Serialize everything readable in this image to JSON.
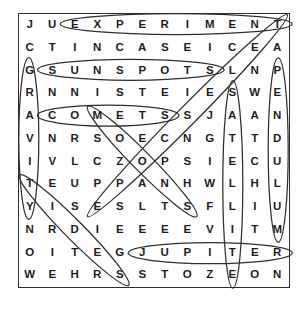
{
  "puzzle": {
    "kind": "word-search",
    "rows_count": 12,
    "cols_count": 12,
    "rows": [
      "JUEXPERIMENT",
      "CTINCASEICEA",
      "GSUNSPOTSLNP",
      "RNNISTEIESWE",
      "ACOMETSSJAAN",
      "VNRSOECNGTTD",
      "IVLCZOPSIECU",
      "TEUPPANHWLHL",
      "YISESLTSFLIU",
      "NRDIEEEEVITM",
      "OITEGJUPITER",
      "WEHRSSTOZEON"
    ]
  },
  "solutions": [
    {
      "word": "EXPERIMENT",
      "start_row": 1,
      "start_col": 3,
      "end_row": 1,
      "end_col": 12,
      "direction": "horizontal"
    },
    {
      "word": "SUNSPOTS",
      "start_row": 3,
      "start_col": 2,
      "end_row": 3,
      "end_col": 9,
      "direction": "horizontal"
    },
    {
      "word": "COMETS",
      "start_row": 5,
      "start_col": 2,
      "end_row": 5,
      "end_col": 7,
      "direction": "horizontal"
    },
    {
      "word": "JUPITER",
      "start_row": 11,
      "start_col": 6,
      "end_row": 11,
      "end_col": 12,
      "direction": "horizontal"
    },
    {
      "word": "GRAVITY",
      "start_row": 3,
      "start_col": 1,
      "end_row": 9,
      "end_col": 1,
      "direction": "vertical"
    },
    {
      "word": "SATELLITE",
      "start_row": 4,
      "start_col": 10,
      "end_row": 12,
      "end_col": 10,
      "direction": "vertical"
    },
    {
      "word": "PENDULUM",
      "start_row": 3,
      "start_col": 12,
      "end_row": 10,
      "end_col": 12,
      "direction": "vertical"
    },
    {
      "word": "TELESCOPE",
      "start_row": 1,
      "start_col": 12,
      "end_row": 9,
      "end_col": 4,
      "direction": "diagonal-down-left"
    },
    {
      "word": "MOONS",
      "start_row": 5,
      "start_col": 4,
      "end_row": 9,
      "end_col": 8,
      "direction": "diagonal-down-right"
    },
    {
      "word": "TIDES",
      "start_row": 8,
      "start_col": 1,
      "end_row": 12,
      "end_col": 5,
      "direction": "diagonal-down-right"
    }
  ],
  "colors": {
    "background": "#ffffff",
    "letter_ink": "#1d1d1d",
    "circle_stroke": "#2e2e2e",
    "border": "#2e2e2e"
  }
}
